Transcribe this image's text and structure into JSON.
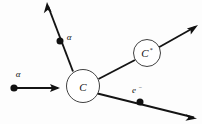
{
  "figure": {
    "background_color": "#fdfdfd",
    "stroke_color": "#141414",
    "circle_fill": "#ffffff",
    "width": 202,
    "height": 124
  },
  "nodes": [
    {
      "id": "central-nucleus",
      "label": "C",
      "superscript": "",
      "cx": 83,
      "cy": 86,
      "r": 16.5
    },
    {
      "id": "excited-nucleus",
      "label": "C",
      "superscript": "*",
      "cx": 147,
      "cy": 53,
      "r": 13.5
    }
  ],
  "particles": [
    {
      "id": "incoming-alpha",
      "label": "α",
      "label_x": 18,
      "label_y": 76,
      "dot_x": 14,
      "dot_y": 88,
      "dot_r": 3.6,
      "has_dot": true,
      "has_arrow": true
    },
    {
      "id": "outgoing-alpha",
      "label": "α",
      "label_x": 68,
      "label_y": 38,
      "dot_x": 60,
      "dot_y": 41,
      "dot_r": 3.4,
      "has_dot": true,
      "has_arrow": true
    },
    {
      "id": "emitted-electron",
      "label": "e",
      "superscript": "−",
      "label_x": 133,
      "label_y": 93,
      "dot_x": 140,
      "dot_y": 102,
      "dot_r": 3.4,
      "has_dot": true,
      "has_arrow": true
    },
    {
      "id": "excited-nucleus-recoil",
      "label": "",
      "superscript": "",
      "has_dot": false,
      "has_arrow": true
    }
  ],
  "tracks": [
    {
      "id": "track-incoming-alpha",
      "x1": 14,
      "y1": 88,
      "x2": 58,
      "y2": 88,
      "width": 1.9
    },
    {
      "id": "track-outgoing-alpha",
      "x1": 73,
      "y1": 71,
      "x2": 48,
      "y2": 5,
      "width": 1.9
    },
    {
      "id": "track-to-excited-nucleus",
      "x1": 98,
      "y1": 79,
      "x2": 135,
      "y2": 60,
      "width": 1.9
    },
    {
      "id": "track-excited-recoil",
      "x1": 159,
      "y1": 47,
      "x2": 196,
      "y2": 26,
      "width": 1.8
    },
    {
      "id": "track-electron",
      "x1": 97,
      "y1": 93,
      "x2": 194,
      "y2": 117,
      "width": 1.9
    }
  ],
  "arrows": [
    {
      "id": "arrow-incoming-alpha",
      "tip_x": 60,
      "tip_y": 88,
      "angle": 0
    },
    {
      "id": "arrow-outgoing-alpha",
      "tip_x": 47,
      "tip_y": 2,
      "angle": -110.7
    },
    {
      "id": "arrow-excited-recoil",
      "tip_x": 198,
      "tip_y": 25,
      "angle": -29.5
    },
    {
      "id": "arrow-electron",
      "tip_x": 196,
      "tip_y": 118,
      "angle": 13.9
    }
  ]
}
